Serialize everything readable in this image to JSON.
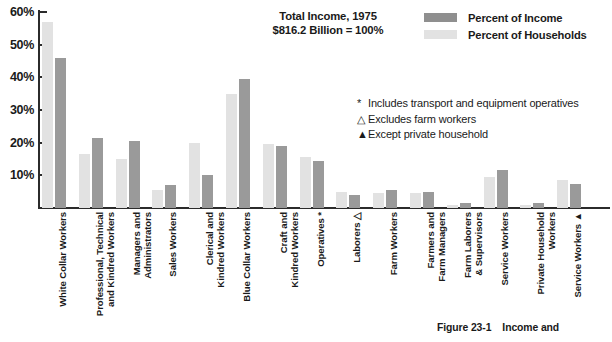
{
  "title": {
    "line1": "Total Income, 1975",
    "line2": "$816.2 Billion = 100%"
  },
  "legend": {
    "position": "top-right",
    "items": [
      {
        "label": "Percent of Income",
        "color": "#8f8f8f"
      },
      {
        "label": "Percent of Households",
        "color": "#e2e2e2"
      }
    ]
  },
  "notes": [
    {
      "marker": "*",
      "text": "Includes transport and equipment operatives"
    },
    {
      "marker": "△",
      "text": "Excludes farm workers"
    },
    {
      "marker": "▲",
      "text": "Except private household"
    }
  ],
  "caption": {
    "figure": "Figure 23-1",
    "text": "Income and"
  },
  "axis": {
    "y_ticks": [
      "10%",
      "20%",
      "30%",
      "40%",
      "50%",
      "60%"
    ]
  },
  "chart_data": {
    "type": "bar",
    "xlabel": "",
    "ylabel": "",
    "ylim": [
      0,
      60
    ],
    "yticks": [
      10,
      20,
      30,
      40,
      50,
      60
    ],
    "grid": false,
    "legend_position": "top-right",
    "categories": [
      "White Collar Workers",
      "Professional, Technical\nand Kindred Workers",
      "Managers and\nAdministrators",
      "Sales Workers",
      "Clerical and\nKindred Workers",
      "Blue Collar Workers",
      "Craft and\nKindred Workers",
      "Operatives *",
      "Laborers △",
      "Farm Workers",
      "Farmers and\nFarm Managers",
      "Farm Laborers\n& Supervisors",
      "Service Workers",
      "Private Household\nWorkers",
      "Service Workers ▲"
    ],
    "series": [
      {
        "name": "Percent of Households",
        "color": "#e2e2e2",
        "values": [
          57,
          16.5,
          15,
          5.5,
          20,
          35,
          19.5,
          15.5,
          5,
          4.5,
          4.5,
          1,
          9.5,
          1,
          8.5
        ]
      },
      {
        "name": "Percent of Income",
        "color": "#9a9a9a",
        "values": [
          46,
          21.5,
          20.5,
          7,
          10,
          39.5,
          19,
          14.5,
          4,
          5.5,
          5,
          1.5,
          11.5,
          1.5,
          7.5
        ]
      }
    ]
  }
}
